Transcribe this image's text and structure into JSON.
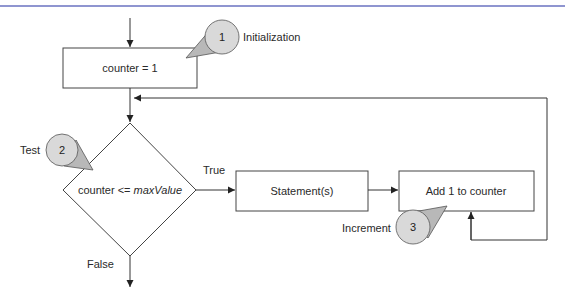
{
  "header": {
    "rule_color": "#6a72c0"
  },
  "diagram": {
    "type": "flowchart",
    "nodes": {
      "init_box": {
        "label": "counter = 1"
      },
      "test_diamond": {
        "label_prefix": "counter <= ",
        "label_var": "maxValue"
      },
      "statement_box": {
        "label": "Statement(s)"
      },
      "increment_box": {
        "label": "Add 1 to counter"
      }
    },
    "edges": {
      "true_label": "True",
      "false_label": "False"
    },
    "callouts": [
      {
        "number": "1",
        "label": "Initialization"
      },
      {
        "number": "2",
        "label": "Test"
      },
      {
        "number": "3",
        "label": "Increment"
      }
    ]
  },
  "colors": {
    "line": "#3a3a3a",
    "callout_fill": "#d9d9d9",
    "callout_tail": "#b8b8b8",
    "rule": "#6a72c0"
  }
}
